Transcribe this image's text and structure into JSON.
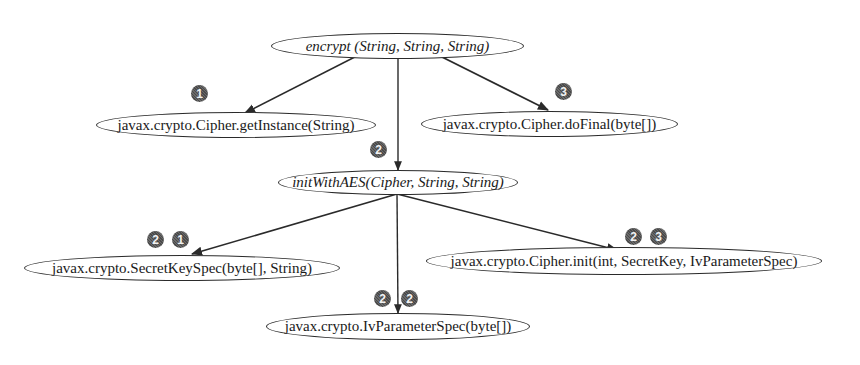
{
  "diagram": {
    "type": "call-graph",
    "nodes": {
      "encrypt": {
        "label": "encrypt (String, String, String)",
        "style": "italic"
      },
      "getInstance": {
        "label": "javax.crypto.Cipher.getInstance(String)",
        "style": "normal"
      },
      "doFinal": {
        "label": "javax.crypto.Cipher.doFinal(byte[])",
        "style": "normal"
      },
      "initWithAES": {
        "label": "initWithAES(Cipher, String, String)",
        "style": "italic"
      },
      "secretKeySpec": {
        "label": "javax.crypto.SecretKeySpec(byte[], String)",
        "style": "normal"
      },
      "ivParameterSpec": {
        "label": "javax.crypto.IvParameterSpec(byte[])",
        "style": "normal"
      },
      "cipherInit": {
        "label": "javax.crypto.Cipher.init(int, SecretKey, IvParameterSpec)",
        "style": "normal"
      }
    },
    "edges": [
      {
        "from": "encrypt",
        "to": "getInstance",
        "order": [
          "1"
        ]
      },
      {
        "from": "encrypt",
        "to": "initWithAES",
        "order": [
          "2"
        ]
      },
      {
        "from": "encrypt",
        "to": "doFinal",
        "order": [
          "3"
        ]
      },
      {
        "from": "initWithAES",
        "to": "secretKeySpec",
        "order": [
          "2",
          "1"
        ]
      },
      {
        "from": "initWithAES",
        "to": "ivParameterSpec",
        "order": [
          "2",
          "2"
        ]
      },
      {
        "from": "initWithAES",
        "to": "cipherInit",
        "order": [
          "2",
          "3"
        ]
      }
    ],
    "colors": {
      "line": "#2a2a2a",
      "badge": "#555555",
      "background": "#ffffff"
    }
  }
}
